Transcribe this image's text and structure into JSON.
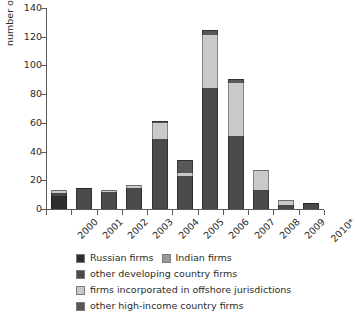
{
  "chart_data": {
    "type": "bar",
    "stacked": true,
    "title": "",
    "xlabel": "",
    "ylabel": "number of new listings",
    "ylim": [
      0,
      140
    ],
    "ytick_step": 20,
    "yticks": [
      0,
      20,
      40,
      60,
      80,
      100,
      120,
      140
    ],
    "grid": false,
    "legend_position": "bottom",
    "categories": [
      "2000",
      "2001",
      "2002",
      "2003",
      "2004",
      "2005",
      "2006",
      "2007",
      "2008",
      "2009",
      "2010*"
    ],
    "series": [
      {
        "name": "Russian firms",
        "color": "#2e2e2e",
        "values": [
          9,
          0,
          0,
          0,
          0,
          0,
          0,
          0,
          0,
          0,
          0
        ]
      },
      {
        "name": "Indian firms",
        "color": "#9a9a9a",
        "values": [
          0,
          0,
          0,
          0,
          0,
          0,
          0,
          0,
          0,
          0,
          0
        ]
      },
      {
        "name": "other developing country firms",
        "color": "#4a4a4a",
        "values": [
          2.5,
          14.5,
          12,
          14.5,
          48.5,
          23,
          84,
          51,
          13,
          2.5,
          4.5
        ]
      },
      {
        "name": "firms incorporated in offshore jurisdictions",
        "color": "#c9c9c9",
        "values": [
          1.5,
          0,
          1.5,
          2,
          11.5,
          2,
          37,
          37,
          14,
          4,
          0
        ]
      },
      {
        "name": "other high-income country firms",
        "color": "#585858",
        "values": [
          0,
          0,
          0,
          0,
          1.5,
          9,
          4,
          2.5,
          0,
          0,
          0
        ]
      }
    ],
    "totals": [
      13,
      14.5,
      13.5,
      16.5,
      61.5,
      34,
      125,
      90.5,
      27,
      6.5,
      4.5
    ],
    "footnote_marker": "*"
  },
  "legend": {
    "rows": [
      [
        {
          "label": "Russian firms",
          "color": "#2e2e2e"
        },
        {
          "label": "Indian firms",
          "color": "#9a9a9a"
        }
      ],
      [
        {
          "label": "other developing country firms",
          "color": "#4a4a4a"
        }
      ],
      [
        {
          "label": "firms incorporated in offshore jurisdictions",
          "color": "#c9c9c9"
        }
      ],
      [
        {
          "label": "other high-income country firms",
          "color": "#585858"
        }
      ]
    ]
  }
}
